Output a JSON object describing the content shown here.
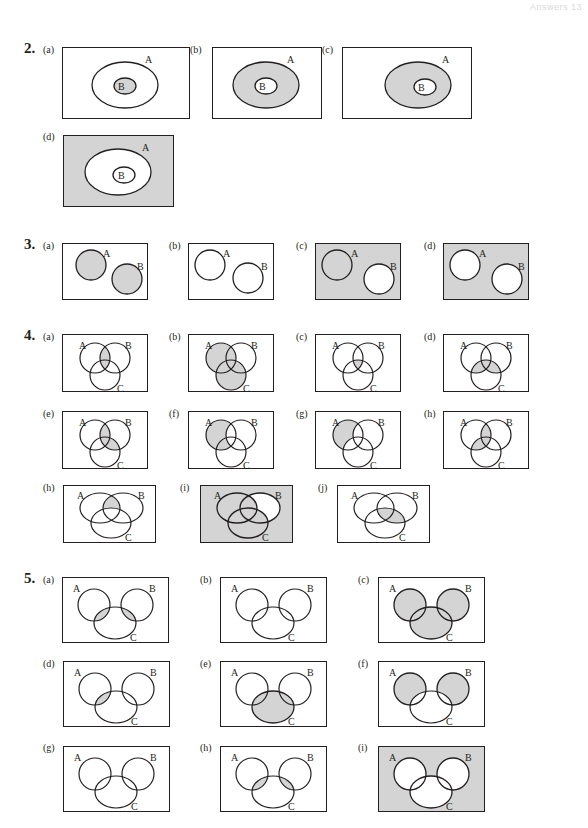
{
  "header": {
    "text": "Answers  13"
  },
  "colors": {
    "shade": "#d4d4d4",
    "line": "#231f20",
    "background": "#ffffff"
  },
  "questions": [
    {
      "number": "2.",
      "figures": [
        {
          "label": "(a)",
          "sets": [
            "A",
            "B"
          ],
          "shaded_region": "B (inside A)"
        },
        {
          "label": "(b)",
          "sets": [
            "A",
            "B"
          ],
          "shaded_region": "A minus B"
        },
        {
          "label": "(c)",
          "sets": [
            "A",
            "B"
          ],
          "shaded_region": "A minus B"
        },
        {
          "label": "(d)",
          "sets": [
            "A",
            "B"
          ],
          "shaded_region": "complement of A"
        }
      ]
    },
    {
      "number": "3.",
      "figures": [
        {
          "label": "(a)",
          "sets": [
            "A",
            "B"
          ],
          "shaded_region": "A and B"
        },
        {
          "label": "(b)",
          "sets": [
            "A",
            "B"
          ],
          "shaded_region": "none"
        },
        {
          "label": "(c)",
          "sets": [
            "A",
            "B"
          ],
          "shaded_region": "complement of B"
        },
        {
          "label": "(d)",
          "sets": [
            "A",
            "B"
          ],
          "shaded_region": "complement of A union B"
        }
      ]
    },
    {
      "number": "4.",
      "figures": [
        {
          "label": "(a)",
          "sets": [
            "A",
            "B",
            "C"
          ],
          "shaded_region": "A ∩ B"
        },
        {
          "label": "(b)",
          "sets": [
            "A",
            "B",
            "C"
          ],
          "shaded_region": "A ∪ C"
        },
        {
          "label": "(c)",
          "sets": [
            "A",
            "B",
            "C"
          ],
          "shaded_region": "A ∩ B ∩ C"
        },
        {
          "label": "(d)",
          "sets": [
            "A",
            "B",
            "C"
          ],
          "shaded_region": "C ∩ (A ∪ B)"
        },
        {
          "label": "(e)",
          "sets": [
            "A",
            "B",
            "C"
          ],
          "shaded_region": "(A ∩ B) ∪ (B ∩ C)"
        },
        {
          "label": "(f)",
          "sets": [
            "A",
            "B",
            "C"
          ],
          "shaded_region": "A minus B"
        },
        {
          "label": "(g)",
          "sets": [
            "A",
            "B",
            "C"
          ],
          "shaded_region": "A minus (B ∪ C)"
        },
        {
          "label": "(h)",
          "sets": [
            "A",
            "B",
            "C"
          ],
          "shaded_region": "(A ∩ B) ∪ (A ∩ C)"
        },
        {
          "label": "(h)",
          "sets": [
            "A",
            "B",
            "C"
          ],
          "shaded_region": "A ∩ B minus C"
        },
        {
          "label": "(i)",
          "sets": [
            "A",
            "B",
            "C"
          ],
          "shaded_region": "complement of B minus (A ∪ C)"
        },
        {
          "label": "(j)",
          "sets": [
            "A",
            "B",
            "C"
          ],
          "shaded_region": "C ∩ B"
        }
      ]
    },
    {
      "number": "5.",
      "figures": [
        {
          "label": "(a)",
          "sets": [
            "A",
            "B",
            "C"
          ],
          "shaded_region": "(A ∩ C) ∪ (B ∩ C)"
        },
        {
          "label": "(b)",
          "sets": [
            "A",
            "B",
            "C"
          ],
          "shaded_region": "none"
        },
        {
          "label": "(c)",
          "sets": [
            "A",
            "B",
            "C"
          ],
          "shaded_region": "A ∪ B ∪ C"
        },
        {
          "label": "(d)",
          "sets": [
            "A",
            "B",
            "C"
          ],
          "shaded_region": "A ∩ C"
        },
        {
          "label": "(e)",
          "sets": [
            "A",
            "B",
            "C"
          ],
          "shaded_region": "C"
        },
        {
          "label": "(f)",
          "sets": [
            "A",
            "B",
            "C"
          ],
          "shaded_region": "(A ∪ B) minus C"
        },
        {
          "label": "(g)",
          "sets": [
            "A",
            "B",
            "C"
          ],
          "shaded_region": "none"
        },
        {
          "label": "(h)",
          "sets": [
            "A",
            "B",
            "C"
          ],
          "shaded_region": "(A ∩ C) ∪ (B ∩ C)"
        },
        {
          "label": "(i)",
          "sets": [
            "A",
            "B",
            "C"
          ],
          "shaded_region": "complement of A ∪ B ∪ C"
        }
      ]
    }
  ]
}
